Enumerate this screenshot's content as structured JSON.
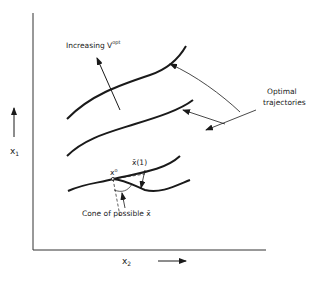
{
  "diagram": {
    "axes": {
      "y_label": "x",
      "y_label_sub": "1",
      "x_label": "x",
      "x_label_sub": "2"
    },
    "labels": {
      "increasing": "Increasing V",
      "increasing_sup": "opt",
      "optimal_line1": "Optimal",
      "optimal_line2": "trajectories",
      "x0": "x",
      "x0_sup": "o",
      "xbar1": "x̄(1)",
      "cone": "Cone of possible x̄"
    },
    "colors": {
      "ink": "#1a1a1a",
      "background": "#ffffff"
    }
  }
}
